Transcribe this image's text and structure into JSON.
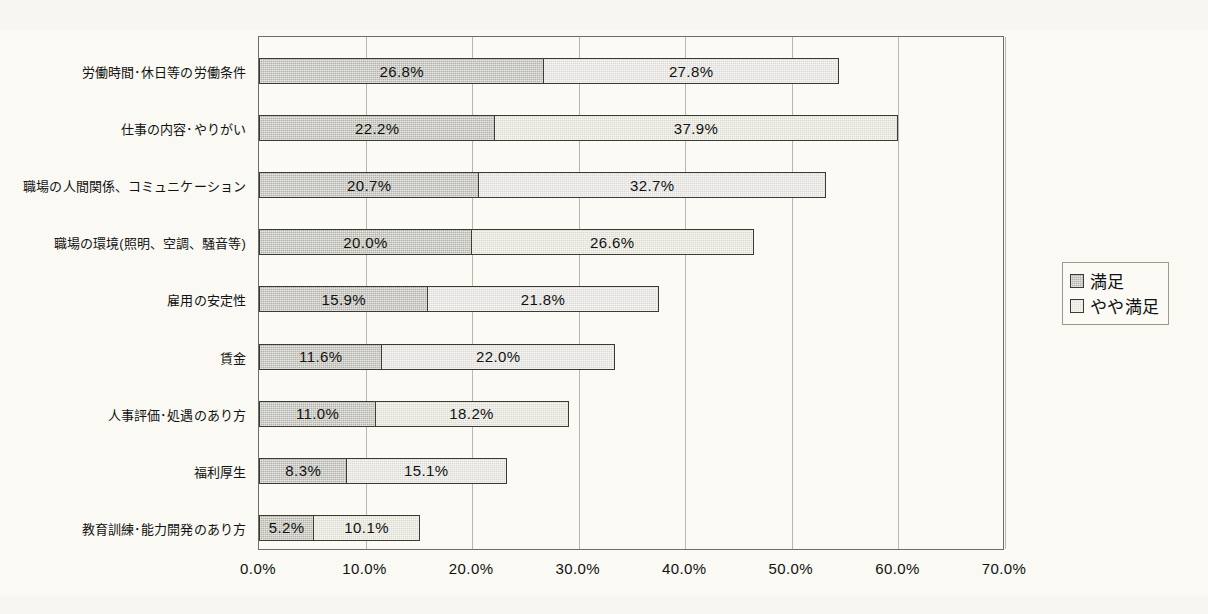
{
  "chart_data": {
    "type": "bar",
    "orientation": "horizontal",
    "stacked": true,
    "title": "",
    "xlabel": "",
    "ylabel": "",
    "xlim": [
      0,
      70
    ],
    "xticks": [
      "0.0%",
      "10.0%",
      "20.0%",
      "30.0%",
      "40.0%",
      "50.0%",
      "60.0%",
      "70.0%"
    ],
    "xtick_values": [
      0,
      10,
      20,
      30,
      40,
      50,
      60,
      70
    ],
    "grid": "vertical",
    "legend_position": "right",
    "categories": [
      "労働時間･休日等の労働条件",
      "仕事の内容･やりがい",
      "職場の人間関係、コミュニケーション",
      "職場の環境(照明、空調、騒音等)",
      "雇用の安定性",
      "賃金",
      "人事評価･処遇のあり方",
      "福利厚生",
      "教育訓練･能力開発のあり方"
    ],
    "series": [
      {
        "name": "満足",
        "color": "#b3b2aa",
        "values": [
          26.8,
          22.2,
          20.7,
          20.0,
          15.9,
          11.6,
          11.0,
          8.3,
          5.2
        ],
        "labels": [
          "26.8%",
          "22.2%",
          "20.7%",
          "20.0%",
          "15.9%",
          "11.6%",
          "11.0%",
          "8.3%",
          "5.2%"
        ]
      },
      {
        "name": "やや満足",
        "color": "#dcdbd2",
        "values": [
          27.8,
          37.9,
          32.7,
          26.6,
          21.8,
          22.0,
          18.2,
          15.1,
          10.1
        ],
        "labels": [
          "27.8%",
          "37.9%",
          "32.7%",
          "26.6%",
          "21.8%",
          "22.0%",
          "18.2%",
          "15.1%",
          "10.1%"
        ]
      }
    ],
    "totals": [
      54.6,
      60.1,
      53.4,
      46.6,
      37.7,
      33.6,
      29.2,
      23.4,
      15.3
    ]
  },
  "legend": {
    "items": [
      {
        "label": "満足",
        "swatch": "dark-gray-swatch"
      },
      {
        "label": "やや満足",
        "swatch": "light-gray-swatch"
      }
    ]
  },
  "colors": {
    "background": "#faf9f3",
    "plot_background": "#fbfaf4",
    "axis": "#6e6d66",
    "gridline": "#b9b8b0",
    "series_1": "#b3b2aa",
    "series_2": "#dcdbd2",
    "bar_border": "#3b3a35",
    "text": "#111111"
  }
}
